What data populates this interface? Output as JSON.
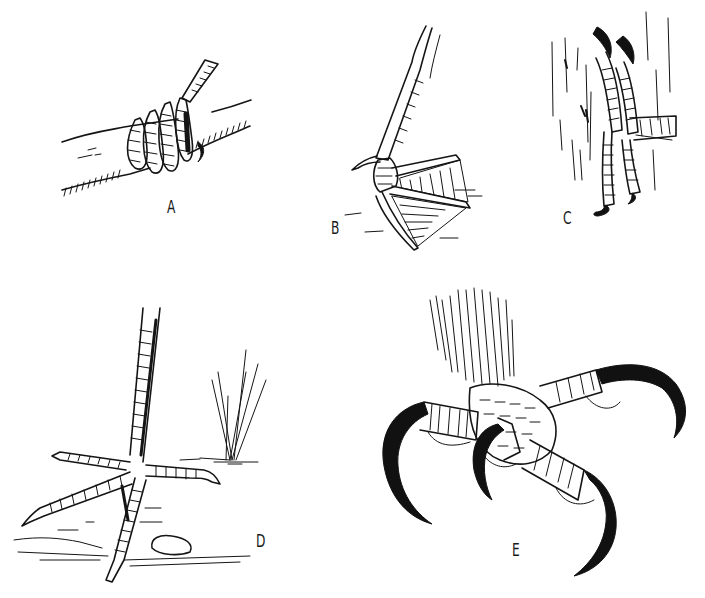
{
  "figure": {
    "background": "#ffffff",
    "ink_color": "#151515",
    "panels": [
      {
        "id": "A",
        "label": "A",
        "subject": "perching foot gripping a branch"
      },
      {
        "id": "B",
        "label": "B",
        "subject": "webbed swimming foot"
      },
      {
        "id": "C",
        "label": "C",
        "subject": "climbing foot on tree bark"
      },
      {
        "id": "D",
        "label": "D",
        "subject": "long-toed wading foot on ground with grass and pebble"
      },
      {
        "id": "E",
        "label": "E",
        "subject": "raptor foot with large curved talons"
      }
    ]
  }
}
